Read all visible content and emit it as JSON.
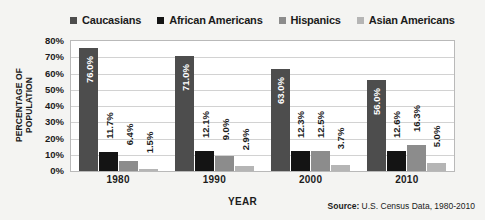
{
  "chart_data": {
    "type": "bar",
    "title": "",
    "xlabel": "YEAR",
    "ylabel": "PERCENTAGE OF POPULATION",
    "ylim": [
      0,
      80
    ],
    "ytick_labels": [
      "80%",
      "70%",
      "60%",
      "50%",
      "40%",
      "30%",
      "20%",
      "10%",
      "0%"
    ],
    "grid": true,
    "legend_position": "top",
    "categories": [
      "1980",
      "1990",
      "2000",
      "2010"
    ],
    "series": [
      {
        "name": "Caucasians",
        "color": "#4d4d4d",
        "values": [
          76.0,
          71.0,
          63.0,
          56.0
        ],
        "labels": [
          "76.0%",
          "71.0%",
          "63.0%",
          "56.0%"
        ],
        "label_placement": [
          "inside",
          "inside",
          "inside",
          "inside"
        ]
      },
      {
        "name": "African Americans",
        "color": "#141414",
        "values": [
          11.7,
          12.1,
          12.3,
          12.6
        ],
        "labels": [
          "11.7%",
          "12.1%",
          "12.3%",
          "12.6%"
        ],
        "label_placement": [
          "outside",
          "outside",
          "outside",
          "outside"
        ]
      },
      {
        "name": "Hispanics",
        "color": "#8c8c8c",
        "values": [
          6.4,
          9.0,
          12.5,
          16.3
        ],
        "labels": [
          "6.4%",
          "9.0%",
          "12.5%",
          "16.3%"
        ],
        "label_placement": [
          "outside",
          "outside",
          "outside",
          "outside"
        ]
      },
      {
        "name": "Asian Americans",
        "color": "#b5b5b5",
        "values": [
          1.5,
          2.9,
          3.7,
          5.0
        ],
        "labels": [
          "1.5%",
          "2.9%",
          "3.7%",
          "5.0%"
        ],
        "label_placement": [
          "outside",
          "outside",
          "outside",
          "outside"
        ]
      }
    ],
    "source_prefix": "Source:",
    "source_text": " U.S. Census Data, 1980-2010"
  }
}
